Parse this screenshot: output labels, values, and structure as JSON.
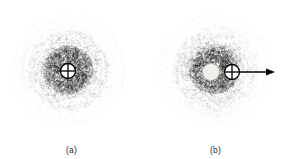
{
  "figure": {
    "background": "#ffffff",
    "ink": "#000000",
    "width": 287,
    "height": 159
  },
  "panels": [
    {
      "id": "a",
      "caption": "(a)",
      "cloud": {
        "center_x": 68,
        "center_y": 70,
        "radius": 58,
        "description": "electron-cloud point scatter"
      },
      "markers": [
        {
          "kind": "crosshair-circle",
          "name": "nucleus-crosshair-marker",
          "cx": 68,
          "cy": 71,
          "r": 7.5,
          "fill": "#ffffff",
          "stroke": "#000000"
        }
      ],
      "arrow": null
    },
    {
      "id": "b",
      "caption": "(b)",
      "cloud": {
        "center_x": 70,
        "center_y": 70,
        "radius": 58,
        "description": "electron-cloud point scatter, displaced core"
      },
      "markers": [
        {
          "kind": "filled-disk",
          "name": "nucleus-disk-marker",
          "cx": 67,
          "cy": 72,
          "r": 8.5,
          "fill": "#f2f0ec",
          "stroke": "#b8b4ae"
        },
        {
          "kind": "crosshair-circle",
          "name": "center-of-charge-crosshair-marker",
          "cx": 88,
          "cy": 72,
          "r": 7.5,
          "fill": "#ffffff",
          "stroke": "#000000"
        }
      ],
      "arrow": {
        "name": "displacement-arrow",
        "x1": 96,
        "y1": 72,
        "x2": 131,
        "y2": 72,
        "stroke": "#000000",
        "head_length": 9,
        "head_width": 7
      }
    }
  ],
  "chart_data": {
    "type": "scatter",
    "title": "",
    "xlabel": "",
    "ylabel": "",
    "subplots": [
      {
        "label": "(a)",
        "description": "Radially symmetric electron probability cloud centred on the nucleus marker; point density highest near centre, decaying toward the rim.",
        "n_points": 2600,
        "center": [
          68,
          70
        ],
        "max_radius": 58,
        "density_profile": "gaussian-annular, peak near r=18",
        "overlays": [
          "crosshair-circle at centre"
        ]
      },
      {
        "label": "(b)",
        "description": "Same cloud with the nucleus disk displaced left of the crosshair centre-of-charge marker; horizontal arrow indicates induced dipole direction.",
        "n_points": 2600,
        "center": [
          70,
          70
        ],
        "max_radius": 58,
        "density_profile": "gaussian-annular, peak near r=18",
        "overlays": [
          "filled nucleus disk",
          "crosshair-circle offset +21 px",
          "arrow pointing right"
        ]
      }
    ]
  }
}
